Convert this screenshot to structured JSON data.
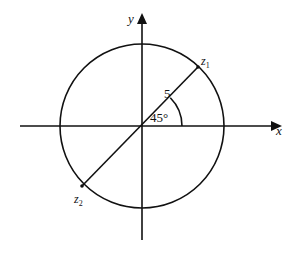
{
  "diagram": {
    "type": "complex-plane-circle",
    "axes": {
      "x_label": "x",
      "y_label": "y"
    },
    "circle": {
      "radius_label": "5",
      "angle_label": "45°"
    },
    "points": [
      {
        "name": "z",
        "subscript": "1",
        "position": "upper-right on circle"
      },
      {
        "name": "z",
        "subscript": "2",
        "position": "lower-left on circle"
      }
    ],
    "colors": {
      "stroke": "#111111",
      "background": "#ffffff"
    }
  }
}
